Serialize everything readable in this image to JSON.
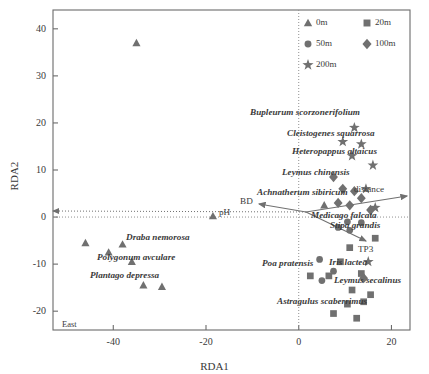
{
  "chart_data": {
    "type": "scatter",
    "title": "",
    "xlabel": "RDA1",
    "ylabel": "RDA2",
    "xlim": [
      -53,
      24
    ],
    "ylim": [
      -24,
      44
    ],
    "xticks": [
      -40,
      -20,
      0,
      20
    ],
    "yticks": [
      -20,
      -10,
      0,
      10,
      20,
      30,
      40
    ],
    "grid": false,
    "zero_lines": "dotted",
    "legend_position": "top-right",
    "marker_color": "#707070",
    "series": [
      {
        "name": "0m",
        "marker": "triangle",
        "points": [
          [
            -35,
            37
          ],
          [
            -46,
            -5.5
          ],
          [
            -41,
            -7.5
          ],
          [
            -38,
            -5.8
          ],
          [
            -36,
            -9.5
          ],
          [
            -33.5,
            -14.5
          ],
          [
            -29.5,
            -14.8
          ],
          [
            -18.5,
            0.2
          ],
          [
            5.5,
            2.5
          ]
        ]
      },
      {
        "name": "20m",
        "marker": "square",
        "points": [
          [
            2.5,
            -12.5
          ],
          [
            6.5,
            -12.5
          ],
          [
            9.0,
            -9.5
          ],
          [
            11.5,
            -15.5
          ],
          [
            10.5,
            -18.5
          ],
          [
            14.0,
            -18.0
          ],
          [
            7.5,
            -20.5
          ],
          [
            12.5,
            -21.5
          ],
          [
            15.5,
            -16.5
          ],
          [
            13.5,
            -12.0
          ],
          [
            11.0,
            -6.5
          ],
          [
            16.5,
            -4.5
          ]
        ]
      },
      {
        "name": "50m",
        "marker": "circle",
        "points": [
          [
            10.5,
            -1.0
          ],
          [
            13.5,
            -1.2
          ],
          [
            11.0,
            -2.8
          ],
          [
            4.5,
            -9.0
          ],
          [
            7.5,
            -11.5
          ],
          [
            5.0,
            -13.5
          ],
          [
            8.5,
            -2.2
          ]
        ]
      },
      {
        "name": "100m",
        "marker": "diamond",
        "points": [
          [
            7.5,
            8.5
          ],
          [
            9.5,
            6.0
          ],
          [
            12.0,
            5.5
          ],
          [
            8.5,
            3.0
          ],
          [
            11.0,
            2.5
          ],
          [
            13.5,
            4.0
          ],
          [
            15.5,
            1.5
          ],
          [
            14.0,
            -13.0
          ]
        ]
      },
      {
        "name": "200m",
        "marker": "star",
        "points": [
          [
            12.0,
            19.0
          ],
          [
            9.5,
            16.0
          ],
          [
            13.5,
            15.5
          ],
          [
            11.5,
            13.0
          ],
          [
            16.0,
            11.0
          ],
          [
            14.5,
            6.0
          ],
          [
            16.5,
            2.0
          ],
          [
            15.0,
            -9.5
          ]
        ]
      }
    ],
    "species_labels": [
      {
        "text": "Bupleurum scorzonerifolium",
        "x": 250,
        "y": 108
      },
      {
        "text": "Cleistogenes squarrosa",
        "x": 287,
        "y": 129
      },
      {
        "text": "Heteropappus altaicus",
        "x": 292,
        "y": 147
      },
      {
        "text": "Leymus chinensis",
        "x": 282,
        "y": 168
      },
      {
        "text": "Achnatherum sibiricum",
        "x": 257,
        "y": 188
      },
      {
        "text": "Medicago falcata",
        "x": 311,
        "y": 211
      },
      {
        "text": "Stipa grandis",
        "x": 330,
        "y": 221
      },
      {
        "text": "Draba nemorosa",
        "x": 126,
        "y": 233
      },
      {
        "text": "Polygonum avculare",
        "x": 97,
        "y": 253
      },
      {
        "text": "Plantago depressa",
        "x": 90,
        "y": 271
      },
      {
        "text": "Poa pratensis",
        "x": 262,
        "y": 259
      },
      {
        "text": "Iris lactea",
        "x": 329,
        "y": 258
      },
      {
        "text": "Leymus secalinus",
        "x": 334,
        "y": 276
      },
      {
        "text": "Astragulus scaberrimus",
        "x": 277,
        "y": 297
      }
    ],
    "env_vectors": [
      {
        "name": "BD",
        "label_x": 240,
        "label_y": 197,
        "x1": 306,
        "y1": 212,
        "x2": 259,
        "y2": 204,
        "style": "solid"
      },
      {
        "name": "pH",
        "label_x": 219,
        "label_y": 208,
        "x1": 306,
        "y1": 212,
        "x2": 53,
        "y2": 211,
        "style": "dotted"
      },
      {
        "name": "distance",
        "label_x": 354,
        "label_y": 185,
        "x1": 306,
        "y1": 212,
        "x2": 407,
        "y2": 196,
        "style": "solid"
      },
      {
        "name": "TP3",
        "label_x": 358,
        "label_y": 245,
        "x1": 306,
        "y1": 212,
        "x2": 366,
        "y2": 241,
        "style": "solid"
      }
    ],
    "corner_annotation": "East",
    "legend": {
      "entries": [
        {
          "label": "0m",
          "marker": "triangle"
        },
        {
          "label": "20m",
          "marker": "square"
        },
        {
          "label": "50m",
          "marker": "circle"
        },
        {
          "label": "100m",
          "marker": "diamond"
        },
        {
          "label": "200m",
          "marker": "star"
        }
      ]
    }
  }
}
